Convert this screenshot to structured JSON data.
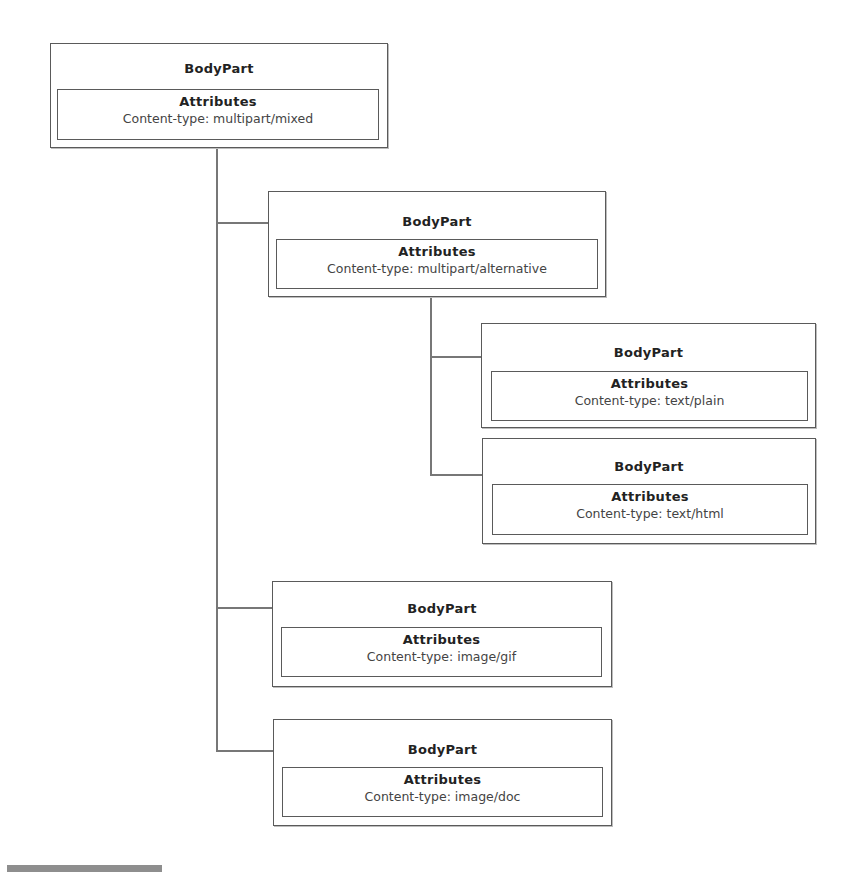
{
  "diagram": {
    "nodes": [
      {
        "id": "root",
        "title": "BodyPart",
        "attributes_label": "Attributes",
        "attribute": "Content-type: multipart/mixed"
      },
      {
        "id": "alternative",
        "title": "BodyPart",
        "attributes_label": "Attributes",
        "attribute": "Content-type: multipart/alternative"
      },
      {
        "id": "plain",
        "title": "BodyPart",
        "attributes_label": "Attributes",
        "attribute": "Content-type: text/plain"
      },
      {
        "id": "html",
        "title": "BodyPart",
        "attributes_label": "Attributes",
        "attribute": "Content-type: text/html"
      },
      {
        "id": "gif",
        "title": "BodyPart",
        "attributes_label": "Attributes",
        "attribute": "Content-type: image/gif"
      },
      {
        "id": "doc",
        "title": "BodyPart",
        "attributes_label": "Attributes",
        "attribute": "Content-type: image/doc"
      }
    ],
    "edges": [
      {
        "from": "root",
        "to": "alternative"
      },
      {
        "from": "alternative",
        "to": "plain"
      },
      {
        "from": "alternative",
        "to": "html"
      },
      {
        "from": "root",
        "to": "gif"
      },
      {
        "from": "root",
        "to": "doc"
      }
    ],
    "colors": {
      "border": "#5a5a5a",
      "connector": "#777777",
      "text": "#222222"
    }
  }
}
